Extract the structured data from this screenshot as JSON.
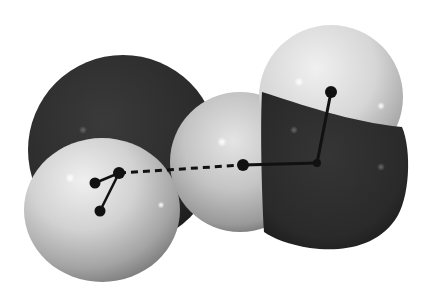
{
  "figure": {
    "background": "#ffffff",
    "colors": {
      "oxygen_dark": "#2c2c2c",
      "oxygen_edge": "#1a1a1a",
      "hydrogen_light": "#e6e6e6",
      "hydrogen_shadow": "#8a8a8a",
      "bond": "#111111",
      "highlight": "#ffffff"
    },
    "atoms": [
      {
        "id": "O1",
        "element": "O",
        "cx": 123,
        "cy": 150,
        "r": 95
      },
      {
        "id": "H1a",
        "element": "H",
        "cx": 102,
        "cy": 210,
        "rx": 78,
        "ry": 72
      },
      {
        "id": "H2a",
        "element": "H",
        "cx": 240,
        "cy": 162,
        "r": 70
      },
      {
        "id": "H2b",
        "element": "H",
        "cx": 331,
        "cy": 97,
        "r": 72
      },
      {
        "id": "O2",
        "element": "O",
        "cx": 330,
        "cy": 170,
        "r": 80
      }
    ],
    "nuclei": [
      {
        "id": "n-O1",
        "x": 119,
        "y": 173
      },
      {
        "id": "n-H1a",
        "x": 95,
        "y": 183
      },
      {
        "id": "n-H1b",
        "x": 100,
        "y": 211
      },
      {
        "id": "n-H2a",
        "x": 243,
        "y": 165
      },
      {
        "id": "n-O2",
        "x": 317,
        "y": 163
      },
      {
        "id": "n-H2b",
        "x": 331,
        "y": 92
      }
    ],
    "bonds": [
      {
        "from": "n-O1",
        "to": "n-H1a",
        "type": "covalent"
      },
      {
        "from": "n-O1",
        "to": "n-H1b",
        "type": "covalent"
      },
      {
        "from": "n-O1",
        "to": "n-H2a",
        "type": "hydrogen"
      },
      {
        "from": "n-H2a",
        "to": "n-O2",
        "type": "covalent"
      },
      {
        "from": "n-O2",
        "to": "n-H2b",
        "type": "covalent"
      }
    ],
    "caption": ""
  }
}
